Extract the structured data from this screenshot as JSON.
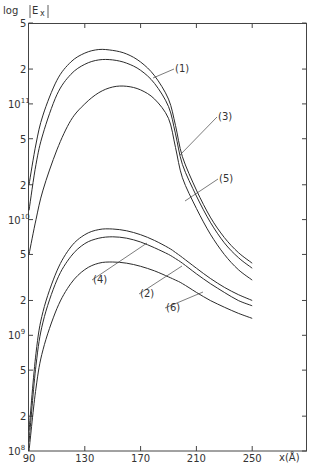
{
  "chart_data": {
    "type": "line",
    "title": "",
    "ylabel": "log |E_x|",
    "xlabel": "x(Å)",
    "yscale": "log",
    "xlim": [
      90,
      290
    ],
    "ylim": [
      100000000.0,
      500000000000.0
    ],
    "grid": false,
    "x_ticks": [
      90,
      130,
      170,
      210,
      250
    ],
    "x_tick_labels": [
      "90",
      "130",
      "170",
      "210",
      "250"
    ],
    "y_ticks": [
      {
        "value": 100000000.0,
        "label": "10",
        "exp": "8"
      },
      {
        "value": 200000000.0,
        "label": "2",
        "exp": ""
      },
      {
        "value": 500000000.0,
        "label": "5",
        "exp": ""
      },
      {
        "value": 1000000000.0,
        "label": "10",
        "exp": "9"
      },
      {
        "value": 2000000000.0,
        "label": "2",
        "exp": ""
      },
      {
        "value": 5000000000.0,
        "label": "5",
        "exp": ""
      },
      {
        "value": 10000000000.0,
        "label": "10",
        "exp": "10"
      },
      {
        "value": 20000000000.0,
        "label": "2",
        "exp": ""
      },
      {
        "value": 50000000000.0,
        "label": "5",
        "exp": ""
      },
      {
        "value": 100000000000.0,
        "label": "10",
        "exp": "11"
      },
      {
        "value": 200000000000.0,
        "label": "2",
        "exp": ""
      },
      {
        "value": 500000000000.0,
        "label": "5",
        "exp": ""
      }
    ],
    "x": [
      90,
      95,
      100,
      110,
      120,
      130,
      140,
      150,
      160,
      170,
      180,
      190,
      195,
      200,
      210,
      220,
      230,
      240,
      250
    ],
    "series": [
      {
        "name": "(1)",
        "values": [
          20000000000.0,
          45000000000.0,
          80000000000.0,
          160000000000.0,
          230000000000.0,
          275000000000.0,
          295000000000.0,
          290000000000.0,
          270000000000.0,
          230000000000.0,
          175000000000.0,
          110000000000.0,
          65000000000.0,
          35000000000.0,
          18000000000.0,
          10500000000.0,
          7000000000.0,
          5200000000.0,
          4200000000.0
        ]
      },
      {
        "name": "(3)",
        "values": [
          12000000000.0,
          30000000000.0,
          55000000000.0,
          120000000000.0,
          180000000000.0,
          220000000000.0,
          240000000000.0,
          240000000000.0,
          225000000000.0,
          195000000000.0,
          150000000000.0,
          95000000000.0,
          55000000000.0,
          30000000000.0,
          16000000000.0,
          9500000000.0,
          6300000000.0,
          4700000000.0,
          3800000000.0
        ]
      },
      {
        "name": "(5)",
        "values": [
          5000000000.0,
          10000000000.0,
          18000000000.0,
          40000000000.0,
          72000000000.0,
          100000000000.0,
          125000000000.0,
          140000000000.0,
          142000000000.0,
          132000000000.0,
          110000000000.0,
          75000000000.0,
          42000000000.0,
          23000000000.0,
          12500000000.0,
          7500000000.0,
          5000000000.0,
          3700000000.0,
          3000000000.0
        ]
      },
      {
        "name": "(4)",
        "values": [
          150000000.0,
          700000000.0,
          1600000000.0,
          3600000000.0,
          5800000000.0,
          7400000000.0,
          8200000000.0,
          8300000000.0,
          8000000000.0,
          7400000000.0,
          6600000000.0,
          5700000000.0,
          5200000000.0,
          4700000000.0,
          3800000000.0,
          3100000000.0,
          2600000000.0,
          2250000000.0,
          2000000000.0
        ]
      },
      {
        "name": "(2)",
        "values": [
          120000000.0,
          550000000.0,
          1300000000.0,
          3000000000.0,
          4800000000.0,
          6200000000.0,
          6900000000.0,
          7100000000.0,
          6900000000.0,
          6400000000.0,
          5700000000.0,
          5000000000.0,
          4600000000.0,
          4200000000.0,
          3400000000.0,
          2800000000.0,
          2350000000.0,
          2000000000.0,
          1800000000.0
        ]
      },
      {
        "name": "(6)",
        "values": [
          100000000.0,
          350000000.0,
          750000000.0,
          1700000000.0,
          2800000000.0,
          3700000000.0,
          4200000000.0,
          4300000000.0,
          4200000000.0,
          3950000000.0,
          3600000000.0,
          3200000000.0,
          3000000000.0,
          2800000000.0,
          2350000000.0,
          2000000000.0,
          1750000000.0,
          1550000000.0,
          1400000000.0
        ]
      }
    ],
    "annotations": [
      {
        "text": "(1)",
        "x_px": 175,
        "y_px": 72,
        "target_px": [
          153,
          78
        ]
      },
      {
        "text": "(3)",
        "x_px": 218,
        "y_px": 120,
        "target_px": [
          180,
          155
        ]
      },
      {
        "text": "(5)",
        "x_px": 219,
        "y_px": 182,
        "target_px": [
          185,
          201
        ]
      },
      {
        "text": "(4)",
        "x_px": 93,
        "y_px": 283,
        "target_px": [
          147,
          243
        ]
      },
      {
        "text": "(2)",
        "x_px": 140,
        "y_px": 297,
        "target_px": [
          182,
          266
        ]
      },
      {
        "text": "(6)",
        "x_px": 166,
        "y_px": 311,
        "target_px": [
          203,
          292
        ]
      }
    ]
  },
  "labels": {
    "y_axis_title": "log",
    "y_axis_symbol": "E",
    "y_axis_sub": "x",
    "x_axis_title": "x(Å)"
  }
}
